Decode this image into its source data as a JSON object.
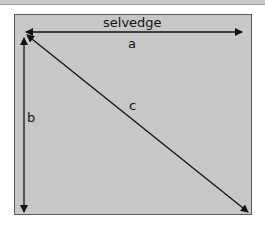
{
  "diagram": {
    "type": "fabric-rectangle-measurement",
    "labels": {
      "top_edge": "selvedge",
      "width": "a",
      "height": "b",
      "diagonal": "c"
    },
    "colors": {
      "fabric_fill": "#c7c7c7",
      "border": "#5a5a5a",
      "arrows": "#111111",
      "top_band": "#c9c9c9"
    },
    "arrows": [
      {
        "name": "a",
        "from": [
          26,
          32
        ],
        "to": [
          242,
          32
        ],
        "heads": "both"
      },
      {
        "name": "b",
        "from": [
          24,
          38
        ],
        "to": [
          24,
          212
        ],
        "heads": "both"
      },
      {
        "name": "c",
        "from": [
          27,
          35
        ],
        "to": [
          248,
          212
        ],
        "heads": "both"
      }
    ]
  }
}
